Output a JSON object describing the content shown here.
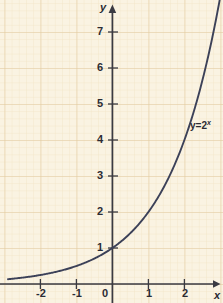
{
  "chart_data": {
    "type": "line",
    "title": "",
    "subtitle": "",
    "xlabel": "x",
    "ylabel": "y",
    "function_label": "y=2",
    "function_exponent": "x",
    "expression": "y = 2^x",
    "xlim": [
      -2.9,
      3.1
    ],
    "ylim": [
      -0.5,
      7.6
    ],
    "xticks": [
      -2,
      -1,
      0,
      1,
      2
    ],
    "xtick_labels": [
      "-2",
      "-1",
      "0",
      "1",
      "2"
    ],
    "yticks": [
      1,
      2,
      3,
      4,
      5,
      6,
      7
    ],
    "ytick_labels": [
      "1",
      "2",
      "3",
      "4",
      "5",
      "6",
      "7"
    ],
    "origin_label": "0",
    "grid": true,
    "grid_minor_step": 0.2,
    "grid_major_step": 1,
    "legend": "none",
    "annotations": [
      {
        "text": "y=2",
        "superscript": "x",
        "x": 2.3,
        "y": 4.3
      }
    ],
    "x": [
      -2.9,
      -2.75,
      -2.5,
      -2.25,
      -2.0,
      -1.75,
      -1.5,
      -1.25,
      -1.0,
      -0.75,
      -0.5,
      -0.25,
      0.0,
      0.25,
      0.5,
      0.75,
      1.0,
      1.25,
      1.5,
      1.75,
      2.0,
      2.25,
      2.5,
      2.75,
      2.95
    ],
    "y": [
      0.134,
      0.149,
      0.177,
      0.21,
      0.25,
      0.297,
      0.354,
      0.42,
      0.5,
      0.595,
      0.707,
      0.841,
      1.0,
      1.189,
      1.414,
      1.682,
      2.0,
      2.378,
      2.828,
      3.364,
      4.0,
      4.757,
      5.657,
      6.727,
      7.726
    ],
    "key_points": [
      {
        "x": -2,
        "y": 0.25
      },
      {
        "x": -1,
        "y": 0.5
      },
      {
        "x": 0,
        "y": 1
      },
      {
        "x": 1,
        "y": 2
      },
      {
        "x": 2,
        "y": 4
      }
    ]
  },
  "colors": {
    "background": "#faf3e2",
    "grid_minor": "#f3e6c8",
    "grid_major": "#e0c9a0",
    "axis": "#3a3a42",
    "curve": "#3c4158",
    "text": "#2b2b33",
    "page": "#ffffff"
  },
  "axes": {
    "y_axis_label": "y",
    "x_axis_label": "x"
  }
}
